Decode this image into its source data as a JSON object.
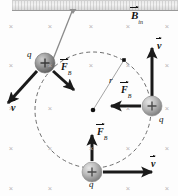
{
  "figure": {
    "background_color": "#fdfdfd",
    "ink_color": "#111111",
    "field_mark_color": "#b9b2b4",
    "orbit_color": "#6d6d6d"
  },
  "field": {
    "symbol": "B",
    "subscript": "in",
    "marker_glyph": "×",
    "marker_name": "field-into-page-cross",
    "label_x": 131,
    "label_y": 17,
    "grid_columns": [
      11,
      50,
      91,
      128,
      167
    ],
    "grid_rows": [
      26,
      65,
      108,
      148,
      188
    ],
    "grid_skip": [
      [
        91,
        108
      ],
      [
        91,
        188
      ]
    ]
  },
  "orbit": {
    "center_x": 93,
    "center_y": 110,
    "radius": 58,
    "dash": "4 3",
    "center_dot_name": "orbit-center-dot",
    "radius_label": "r",
    "radius_label_x": 109,
    "radius_label_y": 82,
    "radius_end_x": 124,
    "radius_end_y": 60
  },
  "source": {
    "plate_name": "source-plate",
    "beam_name": "incoming-particle-beam-line",
    "beam_x1": 73,
    "beam_y1": 9,
    "beam_x2": 48,
    "beam_y2": 72
  },
  "charges": [
    {
      "id": "charge-upper-left",
      "label": "q",
      "sign": "+",
      "cx": 45,
      "cy": 63,
      "r": 10,
      "label_x": 27,
      "label_y": 55,
      "force": {
        "name": "force-vector-upper-left",
        "symbol": "F",
        "subscript": "B",
        "x1": 53,
        "y1": 71,
        "x2": 74,
        "y2": 90,
        "label_x": 64,
        "label_y": 69
      },
      "velocity": {
        "name": "velocity-vector-upper-left",
        "symbol": "v",
        "x1": 37,
        "y1": 71,
        "x2": 8,
        "y2": 103,
        "label_x": 12,
        "label_y": 108
      }
    },
    {
      "id": "charge-right",
      "label": "q",
      "sign": "+",
      "cx": 152,
      "cy": 106,
      "r": 10,
      "label_x": 159,
      "label_y": 120,
      "force": {
        "name": "force-vector-right",
        "symbol": "F",
        "subscript": "B",
        "x1": 141,
        "y1": 106,
        "x2": 111,
        "y2": 106,
        "label_x": 124,
        "label_y": 91
      },
      "velocity": {
        "name": "velocity-vector-right",
        "symbol": "v",
        "x1": 152,
        "y1": 96,
        "x2": 152,
        "y2": 48,
        "label_x": 156,
        "label_y": 44
      }
    },
    {
      "id": "charge-bottom",
      "label": "q",
      "sign": "+",
      "cx": 92,
      "cy": 172,
      "r": 10,
      "label_x": 89,
      "label_y": 185,
      "force": {
        "name": "force-vector-bottom",
        "symbol": "F",
        "subscript": "B",
        "x1": 92,
        "y1": 161,
        "x2": 92,
        "y2": 135,
        "label_x": 98,
        "label_y": 133
      },
      "velocity": {
        "name": "velocity-vector-bottom",
        "symbol": "v",
        "x1": 103,
        "y1": 172,
        "x2": 152,
        "y2": 172,
        "label_x": 152,
        "label_y": 163
      }
    }
  ]
}
